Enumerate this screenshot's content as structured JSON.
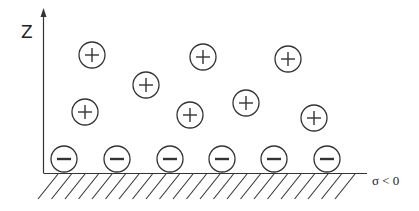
{
  "diagram": {
    "axis_label": "Z",
    "surface_label": "σ < 0",
    "colors": {
      "stroke": "#333333",
      "background": "#ffffff"
    },
    "positive_ions": [
      {
        "cx": 92,
        "cy": 55
      },
      {
        "cx": 146,
        "cy": 85
      },
      {
        "cx": 203,
        "cy": 57
      },
      {
        "cx": 85,
        "cy": 112
      },
      {
        "cx": 190,
        "cy": 115
      },
      {
        "cx": 246,
        "cy": 103
      },
      {
        "cx": 288,
        "cy": 59
      },
      {
        "cx": 314,
        "cy": 118
      }
    ],
    "negative_ions": [
      {
        "cx": 64,
        "cy": 159
      },
      {
        "cx": 117,
        "cy": 159
      },
      {
        "cx": 170,
        "cy": 159
      },
      {
        "cx": 222,
        "cy": 159
      },
      {
        "cx": 274,
        "cy": 159
      },
      {
        "cx": 327,
        "cy": 159
      }
    ],
    "ion_radius": 13,
    "positive_symbol": "+",
    "negative_symbol": "−"
  }
}
